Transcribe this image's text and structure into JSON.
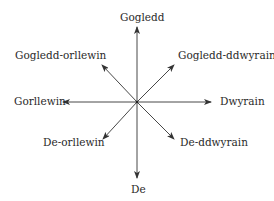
{
  "diagram": {
    "type": "compass-rose",
    "center": "",
    "line_color": "#333333",
    "text_color": "#2a2a2a",
    "directions": {
      "north": "Gogledd",
      "north_east": "Gogledd-ddwyrain",
      "east": "Dwyrain",
      "south_east": "De-ddwyrain",
      "south": "De",
      "south_west": "De-orllewin",
      "west": "Gorllewin",
      "north_west": "Gogledd-orllewin"
    }
  }
}
